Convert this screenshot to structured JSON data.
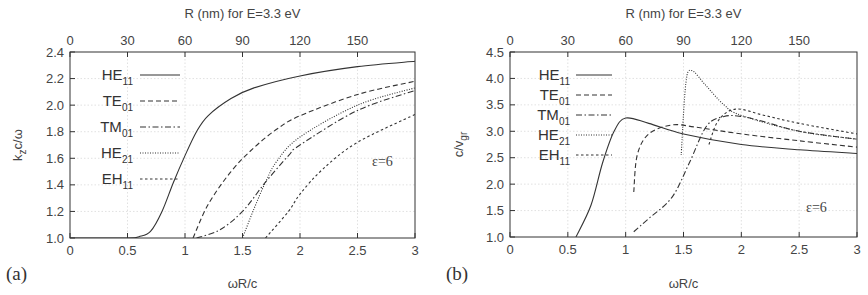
{
  "chart_data": [
    {
      "panel": "(a)",
      "type": "line",
      "title": "",
      "top_xlabel": "R (nm) for E=3.3 eV",
      "top_xticks": [
        0,
        30,
        60,
        90,
        120,
        150
      ],
      "xlabel": "ωR/c",
      "ylabel": "k_z c/ω",
      "xlim": [
        0,
        3
      ],
      "ylim": [
        1.0,
        2.4
      ],
      "xticks": [
        "0",
        "0.5",
        "1",
        "1.5",
        "2",
        "2.5",
        "3"
      ],
      "yticks": [
        "1.0",
        "1.2",
        "1.4",
        "1.6",
        "1.8",
        "2.0",
        "2.2",
        "2.4"
      ],
      "grid": true,
      "legend_position": "upper left",
      "annotation": "ε=6",
      "series": [
        {
          "name": "HE11",
          "style": "solid",
          "x": [
            0,
            0.5,
            0.6,
            0.7,
            0.8,
            0.9,
            1.0,
            1.1,
            1.2,
            1.4,
            1.6,
            2.0,
            2.5,
            3.0
          ],
          "y": [
            1.0,
            1.0,
            1.01,
            1.05,
            1.2,
            1.42,
            1.62,
            1.8,
            1.92,
            2.05,
            2.13,
            2.22,
            2.29,
            2.33
          ]
        },
        {
          "name": "TE01",
          "style": "dashed",
          "x": [
            1.07,
            1.2,
            1.4,
            1.6,
            1.8,
            2.0,
            2.5,
            3.0
          ],
          "y": [
            1.0,
            1.25,
            1.5,
            1.68,
            1.82,
            1.92,
            2.08,
            2.18
          ]
        },
        {
          "name": "TM01",
          "style": "dash-dot",
          "x": [
            1.1,
            1.3,
            1.5,
            1.7,
            1.9,
            2.0,
            2.5,
            3.0
          ],
          "y": [
            1.0,
            1.06,
            1.2,
            1.42,
            1.62,
            1.7,
            1.96,
            2.11
          ]
        },
        {
          "name": "HE21",
          "style": "dotted",
          "x": [
            1.5,
            1.6,
            1.7,
            1.8,
            2.0,
            2.5,
            3.0
          ],
          "y": [
            1.0,
            1.22,
            1.42,
            1.58,
            1.76,
            2.0,
            2.13
          ]
        },
        {
          "name": "EH11",
          "style": "short-dashed",
          "x": [
            1.7,
            1.9,
            2.0,
            2.2,
            2.5,
            3.0
          ],
          "y": [
            1.0,
            1.2,
            1.33,
            1.52,
            1.72,
            1.93
          ]
        }
      ]
    },
    {
      "panel": "(b)",
      "type": "line",
      "title": "",
      "top_xlabel": "R (nm) for E=3.3 eV",
      "top_xticks": [
        0,
        30,
        60,
        90,
        120,
        150
      ],
      "xlabel": "ωR/c",
      "ylabel": "c/v_gr",
      "xlim": [
        0,
        3
      ],
      "ylim": [
        1.0,
        4.5
      ],
      "xticks": [
        "0",
        "0.5",
        "1",
        "1.5",
        "2",
        "2.5",
        "3"
      ],
      "yticks": [
        "1.0",
        "1.5",
        "2.0",
        "2.5",
        "3.0",
        "3.5",
        "4.0",
        "4.5"
      ],
      "grid": true,
      "legend_position": "upper left",
      "annotation": "ε=6",
      "series": [
        {
          "name": "HE11",
          "style": "solid",
          "x": [
            0.57,
            0.7,
            0.8,
            0.9,
            1.0,
            1.2,
            1.5,
            2.0,
            2.5,
            3.0
          ],
          "y": [
            1.0,
            1.6,
            2.4,
            3.0,
            3.25,
            3.15,
            2.95,
            2.75,
            2.65,
            2.58
          ]
        },
        {
          "name": "TE01",
          "style": "dashed",
          "x": [
            1.07,
            1.1,
            1.2,
            1.4,
            1.6,
            2.0,
            2.5,
            3.0
          ],
          "y": [
            1.85,
            2.55,
            2.95,
            3.12,
            3.08,
            2.95,
            2.82,
            2.7
          ]
        },
        {
          "name": "TM01",
          "style": "dash-dot",
          "x": [
            1.07,
            1.2,
            1.4,
            1.55,
            1.7,
            1.85,
            2.0,
            2.2,
            2.5,
            3.0
          ],
          "y": [
            1.1,
            1.35,
            1.75,
            2.4,
            3.1,
            3.28,
            3.28,
            3.18,
            3.0,
            2.85
          ]
        },
        {
          "name": "HE21",
          "style": "dotted",
          "x": [
            1.48,
            1.52,
            1.57,
            1.7,
            1.85,
            2.0,
            2.5,
            3.0
          ],
          "y": [
            2.55,
            3.9,
            4.15,
            3.85,
            3.5,
            3.3,
            3.0,
            2.85
          ]
        },
        {
          "name": "EH11",
          "style": "short-dashed",
          "x": [
            1.72,
            1.8,
            1.95,
            2.2,
            2.5,
            3.0
          ],
          "y": [
            2.75,
            3.2,
            3.42,
            3.3,
            3.15,
            2.95
          ]
        }
      ]
    }
  ],
  "legend": [
    {
      "base": "HE",
      "sub": "11",
      "dash": ""
    },
    {
      "base": "TE",
      "sub": "01",
      "dash": "5 3"
    },
    {
      "base": "TM",
      "sub": "01",
      "dash": "6 2.5 1.5 2.5"
    },
    {
      "base": "HE",
      "sub": "21",
      "dash": "1 1.5"
    },
    {
      "base": "EH",
      "sub": "11",
      "dash": "2.5 2.5"
    }
  ],
  "labels": {
    "top_axis_title": "R (nm) for E=3.3 eV",
    "bottom_axis_title": "ωR/c",
    "ylabel_a_main": "k",
    "ylabel_a_sub": "z",
    "ylabel_a_rest": "c/ω",
    "ylabel_b_main": "c/v",
    "ylabel_b_sub": "gr",
    "panel_a": "(a)",
    "panel_b": "(b)",
    "epsilon": "ε=6"
  }
}
